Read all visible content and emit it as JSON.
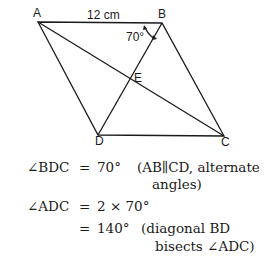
{
  "figure": {
    "vertices": {
      "A": "A",
      "B": "B",
      "C": "C",
      "D": "D",
      "E": "E"
    },
    "side_label": "12 cm",
    "angle_label": "70°"
  },
  "solution": {
    "line1": {
      "lhs": "∠BDC",
      "eq": "=",
      "val": "70°",
      "reason": "(AB∥CD, alternate",
      "reason_cont": "angles)"
    },
    "line2": {
      "lhs": "∠ADC",
      "eq": "=",
      "val": "2 × 70°"
    },
    "line3": {
      "eq": "=",
      "val": "140°",
      "reason": "(diagonal BD",
      "reason_cont": "bisects ∠ADC)"
    }
  }
}
